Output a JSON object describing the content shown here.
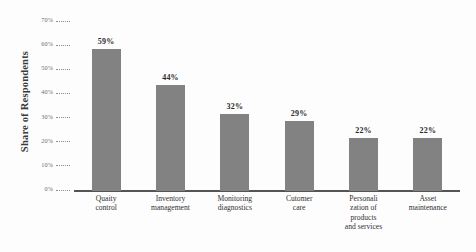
{
  "chart_data": {
    "type": "bar",
    "title": "",
    "xlabel": "",
    "ylabel": "Share of Respondents",
    "ylim": [
      0,
      70
    ],
    "grid": false,
    "legend": null,
    "orientation": "vertical",
    "bar_color": "#828282",
    "axis_color": "#555555",
    "categories": [
      "Quaity control",
      "Inventory management",
      "Monitoring diagnostics",
      "Cutomer care",
      "Personali zation of products and services",
      "Asset maintenance"
    ],
    "category_lines": [
      [
        "Quaity",
        "control"
      ],
      [
        "Inventory",
        "management"
      ],
      [
        "Monitoring",
        "diagnostics"
      ],
      [
        "Cutomer",
        "care"
      ],
      [
        "Personali",
        "zation of",
        "products",
        "and services"
      ],
      [
        "Asset",
        "maintenance"
      ]
    ],
    "values": [
      59,
      44,
      32,
      29,
      22,
      22
    ],
    "value_labels": [
      "59%",
      "44%",
      "32%",
      "29%",
      "22%",
      "22%"
    ],
    "yticks": [
      0,
      10,
      20,
      30,
      40,
      50,
      60,
      70
    ],
    "ytick_labels": [
      "0%",
      "10%",
      "20%",
      "30%",
      "40%",
      "50%",
      "60%",
      "70%"
    ]
  }
}
